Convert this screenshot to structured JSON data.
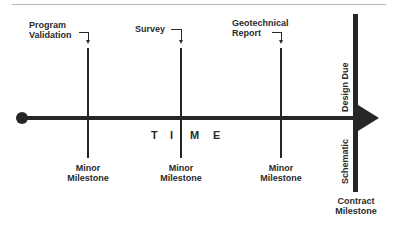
{
  "diagram": {
    "type": "timeline",
    "axis_label_letters": [
      "T",
      "I",
      "M",
      "E"
    ],
    "upper_callouts": [
      {
        "id": "program-validation",
        "lines": [
          "Program",
          "Validation"
        ]
      },
      {
        "id": "survey",
        "lines": [
          "Survey"
        ]
      },
      {
        "id": "geotechnical-report",
        "lines": [
          "Geotechnical",
          "Report"
        ]
      }
    ],
    "minor_milestones": [
      {
        "lines": [
          "Minor",
          "Milestone"
        ]
      },
      {
        "lines": [
          "Minor",
          "Milestone"
        ]
      },
      {
        "lines": [
          "Minor",
          "Milestone"
        ]
      }
    ],
    "contract_milestone": {
      "lines": [
        "Contract",
        "Milestone"
      ],
      "vertical_upper": "Design  Due",
      "vertical_lower": "Schematic"
    },
    "colors": {
      "line": "#262626",
      "text": "#2a2a2a",
      "rule": "#b5b5b5",
      "background": "#ffffff"
    }
  }
}
